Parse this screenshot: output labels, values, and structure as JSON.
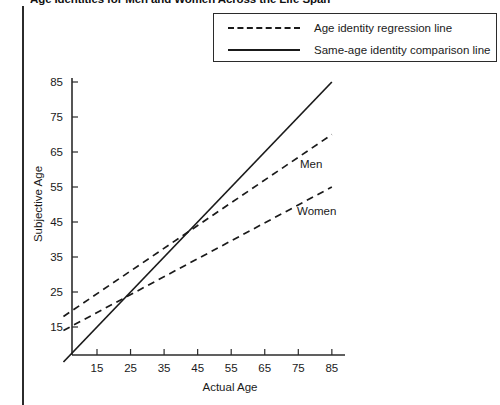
{
  "figure": {
    "title": "Age Identities for Men and Women Across the Life Span",
    "left_rule": "vertical-rule"
  },
  "legend": {
    "position": "top-right",
    "entries": [
      {
        "key": "dashed",
        "label": "Age identity regression line"
      },
      {
        "key": "solid",
        "label": "Same-age identity comparison line"
      }
    ]
  },
  "chart_data": {
    "type": "line",
    "title": "Age Identities for Men and Women Across the Life Span",
    "xlabel": "Actual Age",
    "ylabel": "Subjective Age",
    "xlim": [
      5,
      90
    ],
    "ylim": [
      5,
      90
    ],
    "xticks": [
      15,
      25,
      35,
      45,
      55,
      65,
      75,
      85
    ],
    "yticks": [
      15,
      25,
      35,
      45,
      55,
      65,
      75,
      85
    ],
    "grid": false,
    "legend_position": "top-right",
    "series": [
      {
        "name": "Same-age identity comparison line",
        "style": "solid",
        "x": [
          5,
          85
        ],
        "y": [
          5,
          85
        ]
      },
      {
        "name": "Men",
        "style": "dashed",
        "x": [
          5,
          85
        ],
        "y": [
          18,
          70
        ]
      },
      {
        "name": "Women",
        "style": "dashed",
        "x": [
          5,
          85
        ],
        "y": [
          14,
          55
        ]
      }
    ],
    "annotations": [
      {
        "text": "Men",
        "x": 73,
        "y": 56
      },
      {
        "text": "Women",
        "x": 72,
        "y": 43
      }
    ],
    "colors": {
      "line": "#1a1a1a",
      "axis": "#2b2b2b",
      "background": "#ffffff"
    }
  },
  "axes": {
    "x_title": "Actual Age",
    "y_title": "Subjective Age",
    "x_tick_labels": [
      "15",
      "25",
      "35",
      "45",
      "55",
      "65",
      "75",
      "85"
    ],
    "y_tick_labels": [
      "15",
      "25",
      "35",
      "45",
      "55",
      "65",
      "75",
      "85"
    ]
  }
}
